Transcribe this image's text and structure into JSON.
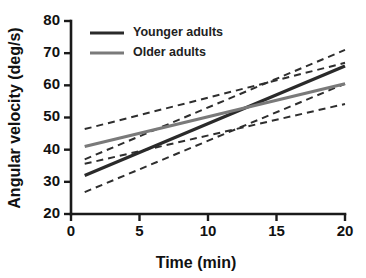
{
  "chart_data": {
    "type": "line",
    "title": "",
    "xlabel": "Time (min)",
    "ylabel": "Angular velocity (deg/s)",
    "xlim": [
      0,
      20
    ],
    "ylim": [
      20,
      80
    ],
    "xticks": [
      0,
      5,
      10,
      15,
      20
    ],
    "yticks": [
      20,
      30,
      40,
      50,
      60,
      70,
      80
    ],
    "xtick_labels": [
      "0",
      "5",
      "10",
      "15",
      "20"
    ],
    "ytick_labels": [
      "20",
      "30",
      "40",
      "50",
      "60",
      "70",
      "80"
    ],
    "grid": false,
    "legend_position": "top-left",
    "x": [
      1,
      20
    ],
    "series": [
      {
        "name": "Younger adults",
        "color": "#2a2a2a",
        "style": "solid",
        "width": 3.2,
        "values": [
          32.0,
          66.0
        ],
        "ci_upper": [
          37.0,
          71.0
        ],
        "ci_lower": [
          26.8,
          60.5
        ]
      },
      {
        "name": "Older adults",
        "color": "#7a7a7a",
        "style": "solid",
        "width": 3.2,
        "values": [
          41.0,
          60.5
        ],
        "ci_upper": [
          46.4,
          67.0
        ],
        "ci_lower": [
          35.6,
          54.2
        ]
      }
    ],
    "ci_style": "dashed",
    "ci_label": "95% confidence band"
  },
  "legend": {
    "items": [
      {
        "label": "Younger adults",
        "color": "#2a2a2a"
      },
      {
        "label": "Older adults",
        "color": "#7a7a7a"
      }
    ]
  },
  "axes": {
    "x_title": "Time (min)",
    "y_title": "Angular velocity (deg/s)"
  },
  "colors": {
    "background": "#ffffff",
    "axis": "#1a1a1a",
    "younger": "#2a2a2a",
    "older": "#7a7a7a"
  }
}
